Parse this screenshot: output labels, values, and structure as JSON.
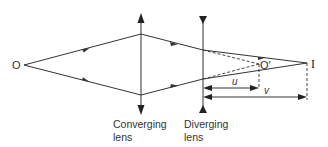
{
  "diagram": {
    "title": "",
    "labels": {
      "object": "O",
      "virtual_object": "O′",
      "image": "I",
      "converging_line1": "Converging",
      "converging_line2": "lens",
      "diverging_line1": "Diverging",
      "diverging_line2": "lens",
      "u": "u",
      "v": "v"
    },
    "colors": {
      "line": "#333333",
      "background": "#ffffff"
    }
  }
}
